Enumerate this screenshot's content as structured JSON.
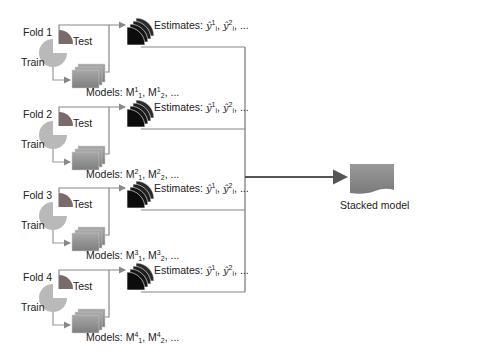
{
  "diagram": {
    "type": "stacking-cross-validation",
    "folds": [
      {
        "label": "Fold 1",
        "test_label": "Test",
        "train_label": "Train",
        "estimates_label": "Estimates:",
        "estimates_terms": [
          "ŷ",
          "1",
          "i",
          "ŷ",
          "2",
          "i",
          "..."
        ],
        "models_label": "Models:",
        "models_terms": [
          "M",
          "1",
          "1",
          "M",
          "1",
          "2",
          "..."
        ]
      },
      {
        "label": "Fold 2",
        "test_label": "Test",
        "train_label": "Train",
        "estimates_label": "Estimates:",
        "estimates_terms": [
          "ŷ",
          "1",
          "i",
          "ŷ",
          "2",
          "i",
          "..."
        ],
        "models_label": "Models:",
        "models_terms": [
          "M",
          "2",
          "1",
          "M",
          "2",
          "2",
          "..."
        ]
      },
      {
        "label": "Fold 3",
        "test_label": "Test",
        "train_label": "Train",
        "estimates_label": "Estimates:",
        "estimates_terms": [
          "ŷ",
          "1",
          "i",
          "ŷ",
          "2",
          "i",
          "..."
        ],
        "models_label": "Models:",
        "models_terms": [
          "M",
          "3",
          "1",
          "M",
          "3",
          "2",
          "..."
        ]
      },
      {
        "label": "Fold 4",
        "test_label": "Test",
        "train_label": "Train",
        "estimates_label": "Estimates:",
        "estimates_terms": [
          "ŷ",
          "1",
          "i",
          "ŷ",
          "2",
          "i",
          "..."
        ],
        "models_label": "Models:",
        "models_terms": [
          "M",
          "4",
          "1",
          "M",
          "4",
          "2",
          "..."
        ]
      }
    ],
    "output": {
      "label": "Stacked model"
    },
    "colors": {
      "test_wedge": "#7a6a6a",
      "train_pie": "#b9b9b9",
      "model_box": "#8e8e8e",
      "estimate_stack": "#1a1a1a",
      "stacked_model": "#8a8a8a",
      "line": "#777777",
      "main_arrow": "#555555"
    }
  }
}
